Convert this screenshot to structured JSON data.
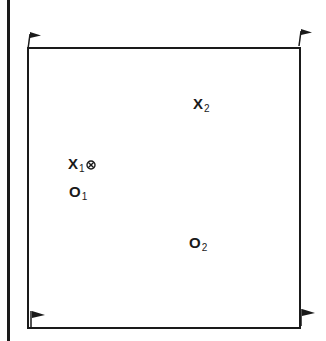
{
  "diagram": {
    "type": "field-layout",
    "border_color": "#1a1a1a",
    "corners": [
      {
        "id": "top-left",
        "icon": "flag-icon"
      },
      {
        "id": "top-right",
        "icon": "flag-icon"
      },
      {
        "id": "bottom-left",
        "icon": "flag-icon"
      },
      {
        "id": "bottom-right",
        "icon": "flag-icon"
      }
    ],
    "labels": {
      "x2": {
        "main": "X",
        "sub": "2"
      },
      "x1": {
        "main": "X",
        "sub": "1",
        "marker": "target-icon"
      },
      "o1": {
        "main": "O",
        "sub": "1"
      },
      "o2": {
        "main": "O",
        "sub": "2"
      }
    }
  }
}
